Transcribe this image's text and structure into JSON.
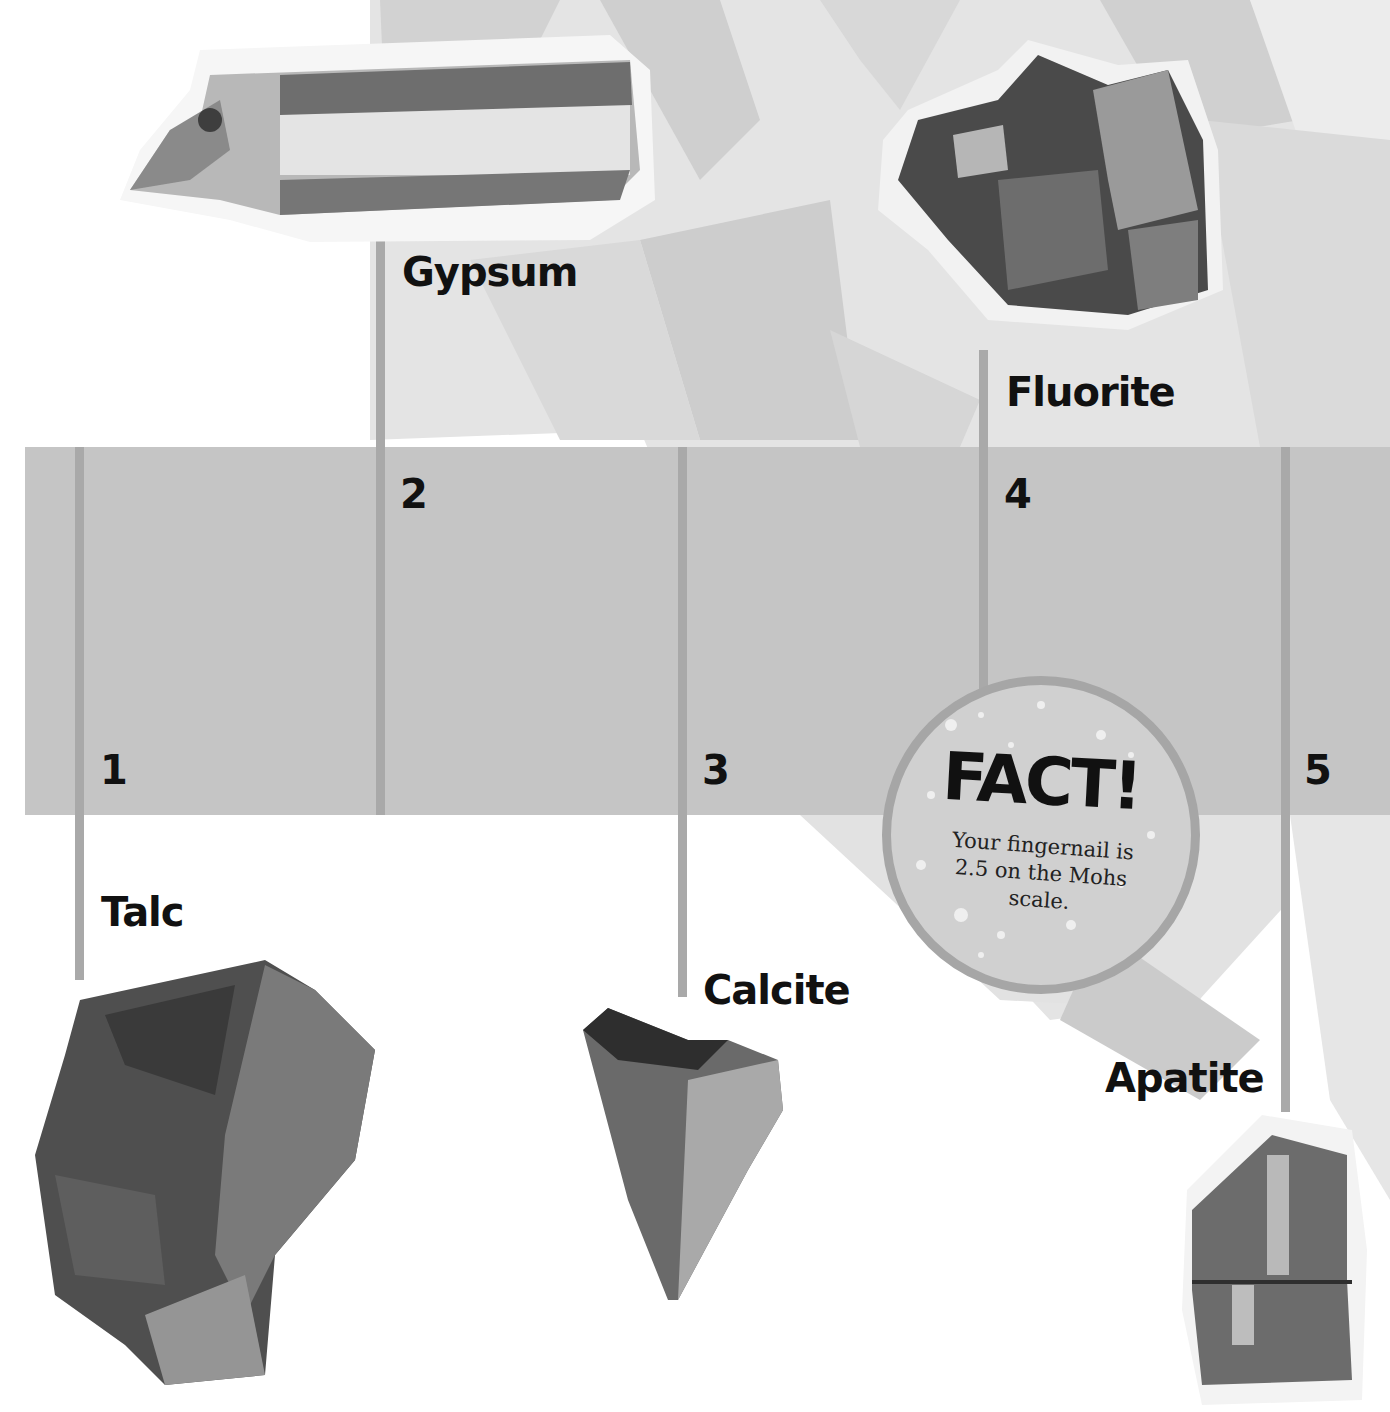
{
  "page": {
    "scale": {
      "band_color": "#c5c5c5",
      "line_color": "#a9a9a9",
      "marks": [
        {
          "number": "1",
          "mineral": "Talc"
        },
        {
          "number": "2",
          "mineral": "Gypsum"
        },
        {
          "number": "3",
          "mineral": "Calcite"
        },
        {
          "number": "4",
          "mineral": "Fluorite"
        },
        {
          "number": "5",
          "mineral": "Apatite"
        }
      ]
    },
    "fact": {
      "title": "FACT!",
      "text": "Your fingernail is 2.5 on the Mohs scale."
    }
  }
}
